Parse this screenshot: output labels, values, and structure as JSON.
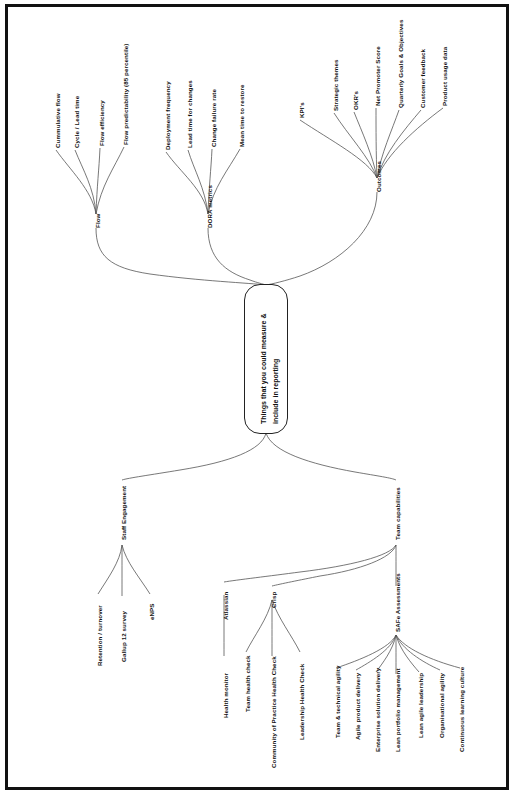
{
  "diagram": {
    "type": "mind-map",
    "orientation": "rotated-90-counterclockwise",
    "central_node": {
      "line1": "Things that you could measure &",
      "line2": "include in reporting"
    },
    "branches": [
      {
        "id": "flow",
        "label": "Flow",
        "children": [
          {
            "label": "Cummulative flow"
          },
          {
            "label": "Cycle / Lead time"
          },
          {
            "label": "Flow efficiency"
          },
          {
            "label": "Flow predictability (85 percentile)"
          }
        ]
      },
      {
        "id": "dora",
        "label": "DORA metrics",
        "children": [
          {
            "label": "Deployment frequency"
          },
          {
            "label": "Lead time for changes"
          },
          {
            "label": "Change failure rate"
          },
          {
            "label": "Mean time to restore"
          }
        ]
      },
      {
        "id": "outcomes",
        "label": "Outcomes",
        "children": [
          {
            "label": "KPI's"
          },
          {
            "label": "Strategic themes"
          },
          {
            "label": "OKR's"
          },
          {
            "label": "Net Promoter Score"
          },
          {
            "label": "Quarterly Goals & Objectives"
          },
          {
            "label": "Customer feedback"
          },
          {
            "label": "Product usage data"
          }
        ]
      },
      {
        "id": "staff-engagement",
        "label": "Staff Engagement",
        "children": [
          {
            "label": "Retention / turnover"
          },
          {
            "label": "Gallup 12 survey"
          },
          {
            "label": "eNPS"
          }
        ]
      },
      {
        "id": "team-capabilities",
        "label": "Team capabilities",
        "children": [
          {
            "label": "Atlassian",
            "children": [
              {
                "label": "Health monitor"
              }
            ]
          },
          {
            "label": "Crisp",
            "children": [
              {
                "label": "Team health check"
              },
              {
                "label": "Community of Practice Health Check"
              },
              {
                "label": "Leadership Health Check"
              }
            ]
          },
          {
            "label": "SAFe Assessments",
            "children": [
              {
                "label": "Team & technical agility"
              },
              {
                "label": "Agile product delivery"
              },
              {
                "label": "Enterprise solution delivery"
              },
              {
                "label": "Lean portfolio  management"
              },
              {
                "label": "Lean agile leadership"
              },
              {
                "label": "Organisational agility"
              },
              {
                "label": "Continuous learning culture"
              }
            ]
          }
        ]
      }
    ],
    "colors": {
      "line": "#555555",
      "text": "#111111",
      "frame": "#111111",
      "background": "#ffffff"
    }
  }
}
